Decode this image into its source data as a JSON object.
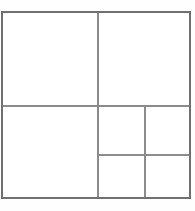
{
  "diagram": {
    "background_color": "#fefefe",
    "canvas": {
      "width": 195,
      "height": 211
    },
    "outer_rectangle": {
      "name": "outer-rectangle",
      "x": 2,
      "y": 12,
      "width": 188,
      "height": 186,
      "stroke_color": "#707070",
      "stroke_width": 1.4,
      "fill": "none"
    },
    "dividers": [
      {
        "name": "vertical-main-divider",
        "orientation": "vertical",
        "x1": 98,
        "y1": 12,
        "x2": 98,
        "y2": 198,
        "stroke_color": "#8c8c8c",
        "stroke_width": 1.3
      },
      {
        "name": "horizontal-main-divider",
        "orientation": "horizontal",
        "x1": 2,
        "y1": 106,
        "x2": 190,
        "y2": 106,
        "stroke_color": "#8c8c8c",
        "stroke_width": 1.3
      },
      {
        "name": "vertical-lower-right-divider",
        "orientation": "vertical",
        "x1": 145,
        "y1": 106,
        "x2": 145,
        "y2": 198,
        "stroke_color": "#8c8c8c",
        "stroke_width": 1.3
      },
      {
        "name": "horizontal-lower-right-divider",
        "orientation": "horizontal",
        "x1": 98,
        "y1": 155,
        "x2": 190,
        "y2": 155,
        "stroke_color": "#8c8c8c",
        "stroke_width": 1.3
      }
    ],
    "regions": [
      {
        "name": "region-top-left",
        "label": "",
        "x": 2,
        "y": 12,
        "width": 96,
        "height": 94,
        "fill": "#ffffff"
      },
      {
        "name": "region-top-right",
        "label": "",
        "x": 98,
        "y": 12,
        "width": 92,
        "height": 94,
        "fill": "#ffffff"
      },
      {
        "name": "region-bottom-left",
        "label": "",
        "x": 2,
        "y": 106,
        "width": 96,
        "height": 92,
        "fill": "#ffffff"
      },
      {
        "name": "region-bottom-middle-upper",
        "label": "",
        "x": 98,
        "y": 106,
        "width": 47,
        "height": 49,
        "fill": "#ffffff"
      },
      {
        "name": "region-bottom-right-upper",
        "label": "",
        "x": 145,
        "y": 106,
        "width": 45,
        "height": 49,
        "fill": "#ffffff"
      },
      {
        "name": "region-bottom-middle-lower",
        "label": "",
        "x": 98,
        "y": 155,
        "width": 47,
        "height": 43,
        "fill": "#ffffff"
      },
      {
        "name": "region-bottom-right-lower",
        "label": "",
        "x": 145,
        "y": 155,
        "width": 45,
        "height": 43,
        "fill": "#ffffff"
      }
    ]
  }
}
